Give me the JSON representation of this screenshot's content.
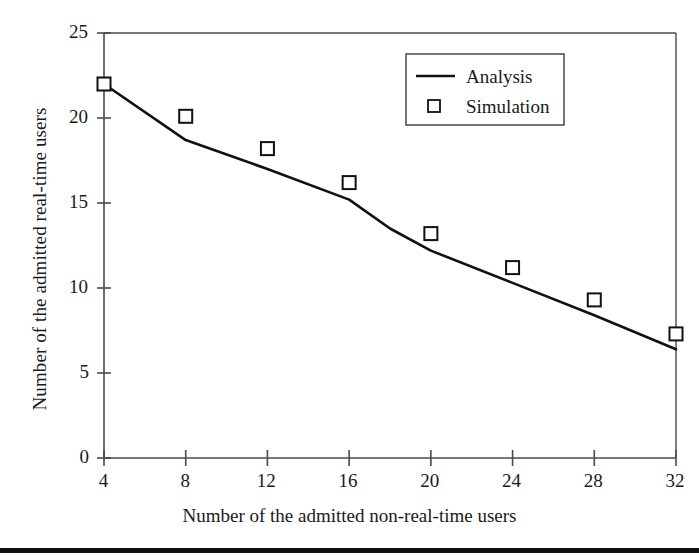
{
  "chart_data": {
    "type": "line",
    "title": "",
    "xlabel": "Number of the admitted non-real-time users",
    "ylabel": "Number of the admitted real-time users",
    "xlim": [
      4,
      32
    ],
    "ylim": [
      0,
      25
    ],
    "xticks": [
      4,
      8,
      12,
      16,
      20,
      24,
      28,
      32
    ],
    "yticks": [
      0,
      5,
      10,
      15,
      20,
      25
    ],
    "grid": false,
    "legend_position": "top-right",
    "x": [
      4,
      8,
      12,
      16,
      20,
      24,
      28,
      32
    ],
    "series": [
      {
        "name": "Analysis",
        "style": "line",
        "x": [
          4,
          8,
          12,
          16,
          18,
          20,
          24,
          28,
          32
        ],
        "values": [
          22.0,
          18.7,
          17.0,
          15.2,
          13.5,
          12.2,
          10.3,
          8.4,
          6.4
        ]
      },
      {
        "name": "Simulation",
        "style": "open-square-markers",
        "x": [
          4,
          8,
          12,
          16,
          20,
          24,
          28,
          32
        ],
        "values": [
          22.0,
          20.1,
          18.2,
          16.2,
          13.2,
          11.2,
          9.3,
          7.3
        ]
      }
    ],
    "legend": [
      "Analysis",
      "Simulation"
    ]
  },
  "axis": {
    "y_tick_labels": [
      "25",
      "20",
      "15",
      "10",
      "5",
      "0"
    ],
    "x_tick_labels": [
      "4",
      "8",
      "12",
      "16",
      "20",
      "24",
      "28",
      "32"
    ],
    "y_title": "Number of the admitted real-time users",
    "x_title": "Number of the admitted non-real-time users"
  },
  "legend": {
    "items": [
      {
        "label": "Analysis",
        "marker": "line-swatch"
      },
      {
        "label": "Simulation",
        "marker": "open-square-swatch"
      }
    ]
  },
  "colors": {
    "ink": "#1a1a1a",
    "axis": "#4a4a4a",
    "line": "#111111",
    "marker_fill": "#ffffff",
    "background": "#ffffff",
    "footer_rule": "#111111"
  }
}
